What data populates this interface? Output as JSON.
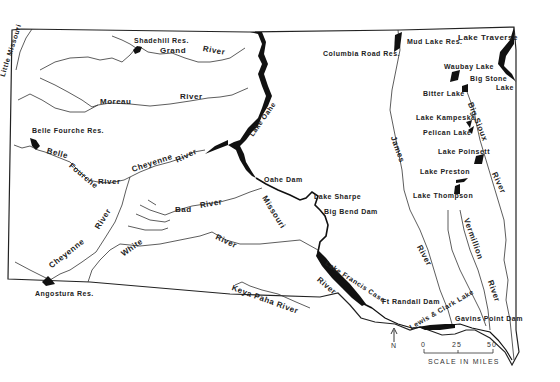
{
  "map": {
    "title": "South Dakota Rivers, Lakes and Reservoirs",
    "colors": {
      "background": "#ffffff",
      "ink": "#1a1a1a",
      "water_fill": "#111111"
    },
    "rivers": {
      "little_missouri": "Little Missouri",
      "grand_1": "Grand",
      "grand_2": "River",
      "moreau_1": "Moreau",
      "moreau_2": "River",
      "belle_fourche_1": "Belle",
      "belle_fourche_2": "Fourche",
      "belle_fourche_3": "River",
      "cheyenne_1": "Cheyenne",
      "cheyenne_2": "River",
      "cheyenne_sw": "Cheyenne",
      "cheyenne_sw_river": "River",
      "bad_1": "Bad",
      "bad_2": "River",
      "white_1": "White",
      "white_2": "River",
      "keya_paha": "Keya Paha River",
      "missouri_1": "Missouri",
      "missouri_river": "River",
      "james_1": "James",
      "james_2": "River",
      "big_sioux_1": "Big Sioux",
      "big_sioux_2": "River",
      "vermillion_1": "Vermillion",
      "vermillion_2": "River"
    },
    "lakes": {
      "shadehill": "Shadehill Res.",
      "columbia_road": "Columbia Road Res.",
      "mud_lake": "Mud Lake Res.",
      "traverse": "Lake Traverse",
      "waubay": "Waubay Lake",
      "big_stone_1": "Big Stone",
      "big_stone_2": "Lake",
      "bitter": "Bitter Lake",
      "kampeska": "Lake Kampeska",
      "pelican": "Pelican Lake",
      "poinsett": "Lake Poinsett",
      "preston": "Lake Preston",
      "thompson": "Lake Thompson",
      "belle_fourche_res": "Belle Fourche Res.",
      "angostura": "Angostura Res.",
      "oahe": "Lake Oahe",
      "sharpe": "Lake Sharpe",
      "francis_case": "Lake Francis Case",
      "lewis_clark": "Lewis & Clark Lake"
    },
    "dams": {
      "oahe_dam": "Oahe Dam",
      "big_bend": "Big Bend Dam",
      "ft_randall": "Ft Randall Dam",
      "gavins_point": "Gavins Point Dam"
    },
    "north_arrow": "N",
    "scale": {
      "ticks": [
        "0",
        "25",
        "50"
      ],
      "label": "SCALE IN MILES"
    }
  }
}
